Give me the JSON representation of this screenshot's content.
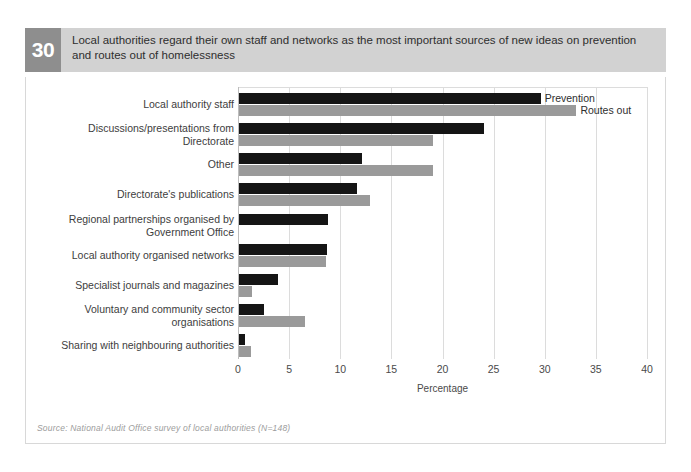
{
  "figure": {
    "number": "30",
    "title": "Local authorities regard their own staff and networks as the most important sources of new ideas on prevention and routes out of homelessness",
    "source": "Source: National Audit Office survey of local authorities (N=148)"
  },
  "legend": {
    "prevention_label": "Prevention",
    "routes_label": "Routes out"
  },
  "colors": {
    "prevention": "#151515",
    "routes": "#9a9a9a",
    "header_band": "#d2d2d2",
    "badge": "#8e8e8e",
    "gridline": "#dcdcdc"
  },
  "chart_data": {
    "type": "bar",
    "orientation": "horizontal",
    "title": "Local authorities regard their own staff and networks as the most important sources of new ideas on prevention and routes out of homelessness",
    "xlabel": "Percentage",
    "ylabel": "",
    "xlim": [
      0,
      40
    ],
    "xticks": [
      0,
      5,
      10,
      15,
      20,
      25,
      30,
      35,
      40
    ],
    "xticklabels": [
      "0",
      "5",
      "10",
      "15",
      "20",
      "25",
      "30",
      "35",
      "40"
    ],
    "grid": "vertical",
    "legend_position": "inline-right-of-first-bars",
    "categories": [
      "Local authority staff",
      "Discussions/presentations from Directorate",
      "Other",
      "Directorate's publications",
      "Regional partnerships organised by Government Office",
      "Local authority organised networks",
      "Specialist journals and magazines",
      "Voluntary and community sector organisations",
      "Sharing with neighbouring authorities"
    ],
    "series": [
      {
        "name": "Prevention",
        "color": "#151515",
        "values": [
          29.5,
          24.0,
          12.0,
          11.5,
          8.7,
          8.6,
          3.8,
          2.4,
          0.6
        ]
      },
      {
        "name": "Routes out",
        "color": "#9a9a9a",
        "values": [
          33.0,
          19.0,
          19.0,
          12.8,
          0,
          8.5,
          1.3,
          6.5,
          1.2
        ]
      }
    ]
  }
}
